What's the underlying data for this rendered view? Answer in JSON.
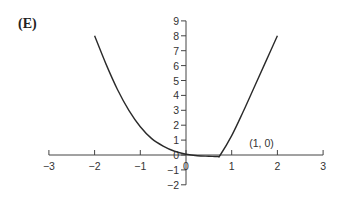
{
  "panel_label": "(E)",
  "chart_data": {
    "type": "line",
    "title": "",
    "xlabel": "",
    "ylabel": "",
    "xlim": [
      -3,
      3
    ],
    "ylim": [
      -2,
      9
    ],
    "grid": false,
    "legend": null,
    "x_ticks": [
      -3,
      -2,
      -1,
      0,
      1,
      2,
      3
    ],
    "x_tick_labels": [
      "−3",
      "−2",
      "−1",
      "0",
      "1",
      "2",
      "3"
    ],
    "y_ticks": [
      -2,
      -1,
      0,
      1,
      2,
      3,
      4,
      5,
      6,
      7,
      8,
      9
    ],
    "y_tick_labels": [
      "−2",
      "−1",
      "0",
      "1",
      "2",
      "3",
      "4",
      "5",
      "6",
      "7",
      "8",
      "9"
    ],
    "annotations": [
      {
        "text": "(1, 0)",
        "x": 1.1,
        "y": 0.5
      }
    ],
    "series": [
      {
        "name": "f(x)",
        "x": [
          -2.0,
          -1.75,
          -1.5,
          -1.25,
          -1.0,
          -0.75,
          -0.5,
          -0.25,
          0.0,
          0.25,
          0.5,
          0.7,
          0.75,
          1.0,
          1.25,
          1.5,
          1.75,
          2.0
        ],
        "y": [
          8.0,
          6.1,
          4.4,
          3.0,
          1.9,
          1.1,
          0.6,
          0.25,
          0.05,
          -0.05,
          -0.08,
          -0.1,
          0.0,
          1.3,
          2.9,
          4.6,
          6.3,
          8.0
        ]
      }
    ]
  }
}
